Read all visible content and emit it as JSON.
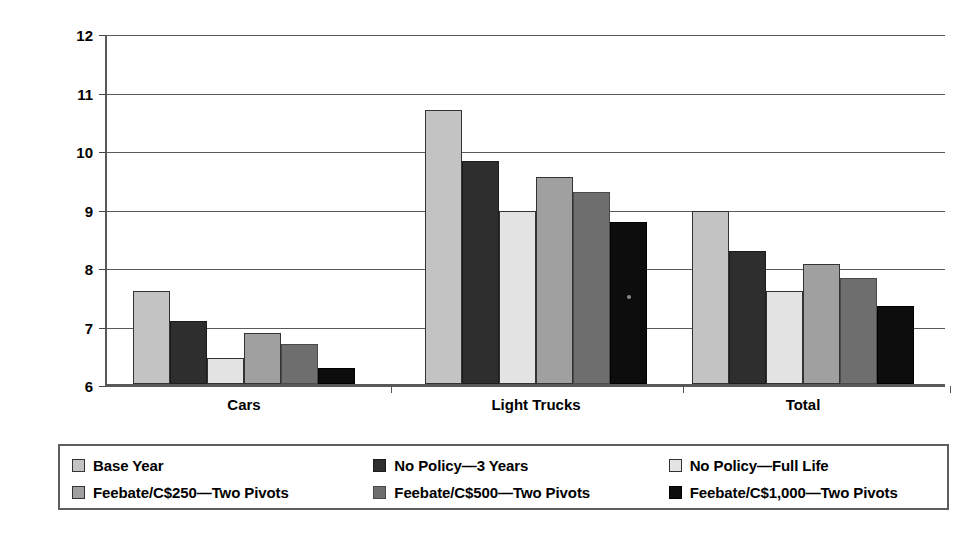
{
  "chart_data": {
    "type": "bar",
    "title": "",
    "xlabel": "",
    "ylabel": "Fuel Consumption (L/100km)",
    "ylim": [
      6,
      12
    ],
    "ytick_labels": [
      "12",
      "11",
      "10",
      "9",
      "8",
      "7",
      "6"
    ],
    "ytick_values": [
      12,
      11,
      10,
      9,
      8,
      7,
      6
    ],
    "grid": true,
    "legend_position": "bottom",
    "categories": [
      "Cars",
      "Light Trucks",
      "Total"
    ],
    "series": [
      {
        "name": "Base Year",
        "color": "#c3c3c3",
        "values": [
          7.63,
          10.72,
          8.99
        ]
      },
      {
        "name": "No Policy—3 Years",
        "color": "#2e2e2e",
        "values": [
          7.11,
          9.84,
          8.31
        ]
      },
      {
        "name": "No Policy—Full Life",
        "color": "#e3e3e3",
        "values": [
          6.48,
          9.0,
          7.63
        ]
      },
      {
        "name": "Feebate/C$250—Two Pivots",
        "color": "#a0a0a0",
        "values": [
          6.91,
          9.58,
          8.08
        ]
      },
      {
        "name": "Feebate/C$500—Two Pivots",
        "color": "#6e6e6e",
        "values": [
          6.71,
          9.31,
          7.85
        ]
      },
      {
        "name": "Feebate/C$1,000—Two Pivots",
        "color": "#0d0d0d",
        "values": [
          6.3,
          8.8,
          7.37
        ]
      }
    ]
  },
  "legend": {
    "rows": [
      [
        {
          "label": "Base Year",
          "swatch": "s0"
        },
        {
          "label": "No Policy—3 Years",
          "swatch": "s1"
        },
        {
          "label": "No Policy—Full Life",
          "swatch": "s2"
        }
      ],
      [
        {
          "label": "Feebate/C$250—Two Pivots",
          "swatch": "s3"
        },
        {
          "label": "Feebate/C$500—Two Pivots",
          "swatch": "s4"
        },
        {
          "label": "Feebate/C$1,000—Two Pivots",
          "swatch": "s5"
        }
      ]
    ]
  }
}
